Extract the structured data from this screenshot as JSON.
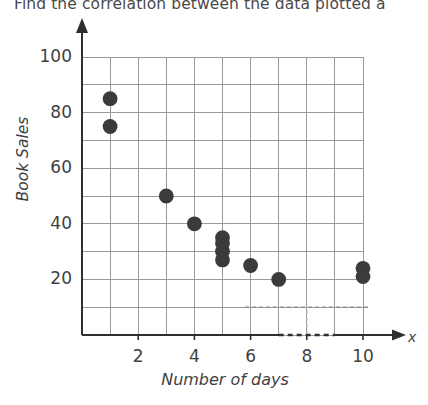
{
  "title": "Find the correlation between the data plotted a",
  "chart_data": {
    "type": "scatter",
    "title": "Find the correlation between the data plotted a",
    "xlabel": "Number of days",
    "ylabel": "Book Sales",
    "axis_letter_x": "x",
    "xlim": [
      0,
      10
    ],
    "ylim": [
      0,
      100
    ],
    "grid": true,
    "grid_x_step": 1,
    "grid_y_step": 10,
    "xticks": [
      2,
      4,
      6,
      8,
      10
    ],
    "yticks": [
      20,
      40,
      60,
      80,
      100
    ],
    "point_color": "#3b3b3b",
    "grid_color": "#9a9a9a",
    "axis_color": "#2f2f2f",
    "correlation": "negative",
    "points": [
      {
        "x": 1,
        "y": 85
      },
      {
        "x": 1,
        "y": 75
      },
      {
        "x": 3,
        "y": 50
      },
      {
        "x": 4,
        "y": 40
      },
      {
        "x": 5,
        "y": 35
      },
      {
        "x": 5,
        "y": 33
      },
      {
        "x": 5,
        "y": 30
      },
      {
        "x": 5,
        "y": 27
      },
      {
        "x": 6,
        "y": 25
      },
      {
        "x": 7,
        "y": 20
      },
      {
        "x": 10,
        "y": 24
      },
      {
        "x": 10,
        "y": 21
      }
    ],
    "annotations": [
      {
        "type": "dashed-horizontal",
        "y": 10,
        "x_from": 5.8,
        "x_to": 10.2
      },
      {
        "type": "dashed-vertical",
        "x": 8,
        "y_from": 0,
        "y_to": 10
      }
    ]
  }
}
